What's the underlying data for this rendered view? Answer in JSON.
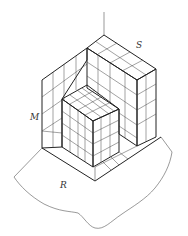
{
  "figure": {
    "type": "isometric grid-block diagram",
    "labels": {
      "S": "S",
      "M": "M",
      "R": "R"
    },
    "colors": {
      "line": "#222222",
      "background": "#ffffff"
    }
  }
}
